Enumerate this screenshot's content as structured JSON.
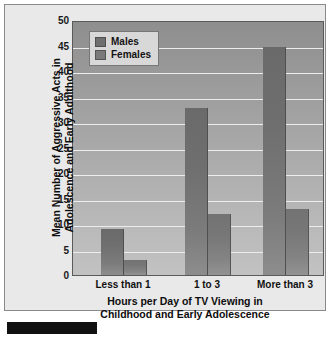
{
  "chart_data": {
    "type": "bar",
    "title": "",
    "categories": [
      "Less than 1",
      "1 to 3",
      "More than 3"
    ],
    "series": [
      {
        "name": "Males",
        "values": [
          9,
          33,
          45
        ],
        "color": "#6f6f6f"
      },
      {
        "name": "Females",
        "values": [
          3,
          12,
          13
        ],
        "color": "#7a7a7a"
      }
    ],
    "xlabel": "Hours per Day of TV Viewing in Childhood and Early Adolescence",
    "ylabel": "Mean Number of Aggressive Acts in Adolescence and Early Adulthood",
    "ylim": [
      0,
      50
    ],
    "yticks": [
      0,
      5,
      10,
      15,
      20,
      25,
      30,
      35,
      40,
      45,
      50
    ],
    "ytick_labels": [
      "0",
      "5",
      "10",
      "15",
      "20",
      "25",
      "30",
      "35",
      "40",
      "45",
      "50"
    ],
    "grid": true,
    "legend_position": "upper-left",
    "legend_entries": [
      "Males",
      "Females"
    ]
  },
  "axis": {
    "y_title_line1": "Mean Number of Aggressive Acts in",
    "y_title_line2": "Adolescence and Early Adulthood",
    "x_title_line1": "Hours per Day of TV Viewing in",
    "x_title_line2": "Childhood and Early Adolescence"
  },
  "legend": {
    "males_label": "Males",
    "females_label": "Females"
  },
  "ticks": {
    "y": [
      "50",
      "45",
      "40",
      "35",
      "30",
      "25",
      "20",
      "15",
      "10",
      "5",
      "0"
    ],
    "x": [
      "Less than 1",
      "1 to 3",
      "More than 3"
    ]
  }
}
